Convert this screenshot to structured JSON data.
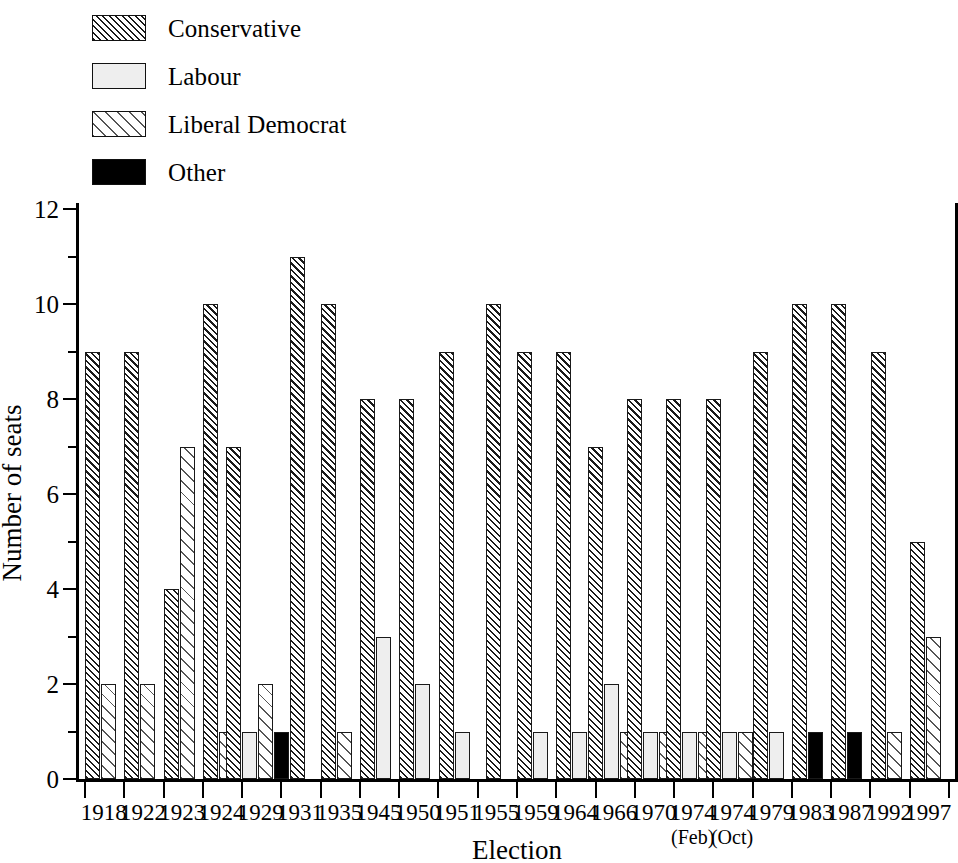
{
  "legend": {
    "items": [
      {
        "label": "Conservative",
        "key": "con",
        "swatch": "dense-diagonal-hatch",
        "color": "#1a1a1a"
      },
      {
        "label": "Labour",
        "key": "lab",
        "swatch": "light-solid-fill",
        "color": "#eeeeee"
      },
      {
        "label": "Liberal Democrat",
        "key": "lib",
        "swatch": "sparse-diagonal-hatch",
        "color": "#555555"
      },
      {
        "label": "Other",
        "key": "oth",
        "swatch": "black-solid-fill",
        "color": "#000000"
      }
    ]
  },
  "axes": {
    "y_label": "Number of seats",
    "x_label": "Election",
    "y_ticks": [
      "0",
      "2",
      "4",
      "6",
      "8",
      "10",
      "12"
    ],
    "y_minor_ticks": [
      "1",
      "3",
      "5",
      "7",
      "9",
      "11"
    ]
  },
  "chart_data": {
    "type": "bar",
    "title": "",
    "xlabel": "Election",
    "ylabel": "Number of seats",
    "ylim": [
      0,
      12
    ],
    "ytick_step": 2,
    "yminor_step": 1,
    "grid": false,
    "legend_position": "top-left",
    "categories": [
      "1918",
      "1922",
      "1923",
      "1924",
      "1929",
      "1931",
      "1935",
      "1945",
      "1950",
      "1951",
      "1955",
      "1959",
      "1964",
      "1966",
      "1970",
      "1974 (Feb)",
      "1974 (Oct)",
      "1979",
      "1983",
      "1987",
      "1992",
      "1997"
    ],
    "category_sublabels": [
      "",
      "",
      "",
      "",
      "",
      "",
      "",
      "",
      "",
      "",
      "",
      "",
      "",
      "",
      "",
      "(Feb)",
      "(Oct)",
      "",
      "",
      "",
      "",
      ""
    ],
    "series": [
      {
        "name": "Conservative",
        "key": "con",
        "values": [
          9,
          9,
          4,
          10,
          7,
          11,
          10,
          8,
          8,
          9,
          10,
          9,
          9,
          7,
          8,
          8,
          8,
          9,
          10,
          10,
          9,
          5
        ]
      },
      {
        "name": "Labour",
        "key": "lab",
        "values": [
          0,
          0,
          0,
          0,
          1,
          0,
          0,
          3,
          2,
          1,
          0,
          1,
          1,
          2,
          1,
          1,
          1,
          1,
          0,
          0,
          0,
          0
        ]
      },
      {
        "name": "Liberal Democrat",
        "key": "lib",
        "values": [
          2,
          2,
          7,
          1,
          2,
          0,
          1,
          0,
          0,
          0,
          0,
          0,
          0,
          1,
          1,
          1,
          1,
          0,
          0,
          0,
          1,
          3
        ]
      },
      {
        "name": "Other",
        "key": "oth",
        "values": [
          0,
          0,
          0,
          0,
          1,
          0,
          0,
          0,
          0,
          0,
          0,
          0,
          0,
          0,
          0,
          0,
          0,
          0,
          1,
          1,
          0,
          0
        ]
      }
    ]
  }
}
